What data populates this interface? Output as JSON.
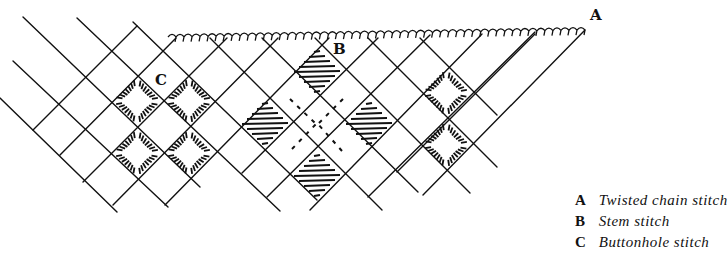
{
  "labels": {
    "A": {
      "text": "A",
      "x": 590,
      "y": 18
    },
    "B": {
      "text": "B",
      "x": 333,
      "y": 52
    },
    "C": {
      "text": "C",
      "x": 155,
      "y": 83
    }
  },
  "legend": [
    {
      "key": "A",
      "text": "Twisted chain stitch"
    },
    {
      "key": "B",
      "text": "Stem stitch"
    },
    {
      "key": "C",
      "text": "Buttonhole stitch"
    }
  ],
  "diagram": {
    "stroke": "#111111",
    "back_lines": [
      [
        0,
        98,
        117,
        212
      ],
      [
        13,
        61,
        168,
        207
      ],
      [
        23,
        17,
        200,
        187
      ],
      [
        77,
        18,
        280,
        211
      ],
      [
        133,
        22,
        317,
        200
      ],
      [
        210,
        38,
        382,
        210
      ],
      [
        262,
        38,
        418,
        192
      ],
      [
        315,
        38,
        470,
        193
      ],
      [
        368,
        38,
        497,
        167
      ],
      [
        420,
        38,
        497,
        115
      ]
    ],
    "fwd_lines": [
      [
        33,
        130,
        137,
        26
      ],
      [
        60,
        155,
        176,
        38
      ],
      [
        83,
        182,
        227,
        38
      ],
      [
        113,
        205,
        278,
        38
      ],
      [
        165,
        205,
        329,
        38
      ],
      [
        242,
        173,
        378,
        38
      ],
      [
        267,
        197,
        430,
        35
      ],
      [
        310,
        210,
        482,
        34
      ],
      [
        368,
        197,
        535,
        32
      ],
      [
        397,
        172,
        535,
        34
      ],
      [
        423,
        195,
        585,
        30
      ]
    ],
    "chain_top": [
      168,
      37,
      585,
      30
    ],
    "buttonhole_squares": [
      [
        137,
        101
      ],
      [
        189,
        101
      ],
      [
        137,
        153
      ],
      [
        189,
        153
      ],
      [
        446,
        93
      ],
      [
        446,
        145
      ]
    ],
    "stem_cells": [
      [
        317,
        72
      ],
      [
        265,
        124
      ],
      [
        369,
        124
      ],
      [
        317,
        176
      ]
    ],
    "stem_dashes": [
      [
        290,
        99,
        316,
        124
      ],
      [
        343,
        99,
        318,
        124
      ],
      [
        292,
        149,
        316,
        124
      ],
      [
        342,
        151,
        318,
        124
      ]
    ]
  }
}
